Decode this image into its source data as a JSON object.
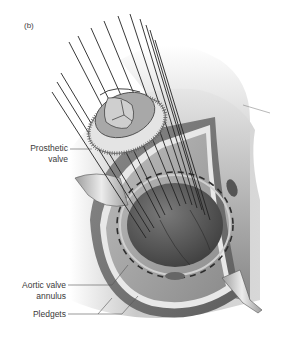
{
  "figure": {
    "panel_label": "(b)",
    "labels": {
      "prosthetic_valve_line1": "Prosthetic",
      "prosthetic_valve_line2": "valve",
      "aortic_annulus_line1": "Aortic valve",
      "aortic_annulus_line2": "annulus",
      "pledgets": "Pledgets"
    },
    "colors": {
      "background": "#ffffff",
      "tissue_dark": "#6e6e6e",
      "tissue_mid": "#9a9a9a",
      "tissue_light": "#c8c8c8",
      "lumen": "#5a5a5a",
      "sutures": "#222222",
      "label_text": "#3a3a3a"
    }
  }
}
